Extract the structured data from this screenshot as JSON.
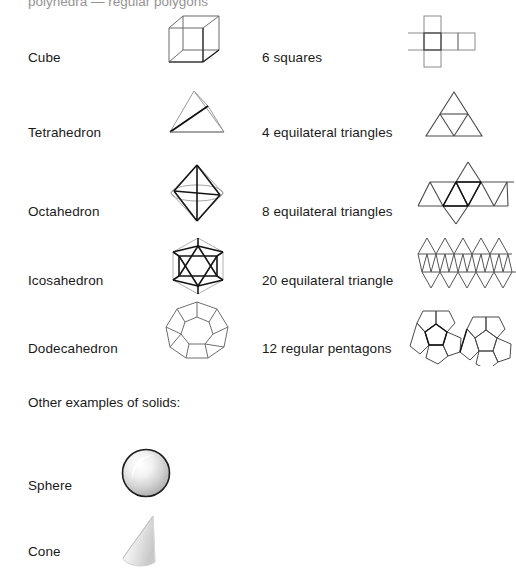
{
  "document": {
    "clipped_header": "polyhedra — regular polygons",
    "section_heading": "Other examples of solids:"
  },
  "platonic_solids": [
    {
      "name": "Cube",
      "solid_icon": "cube-wireframe-icon",
      "faces_description": "6 squares",
      "net_icon": "cube-net-icon"
    },
    {
      "name": "Tetrahedron",
      "solid_icon": "tetrahedron-wireframe-icon",
      "faces_description": "4 equilateral triangles",
      "net_icon": "tetrahedron-net-icon"
    },
    {
      "name": "Octahedron",
      "solid_icon": "octahedron-wireframe-icon",
      "faces_description": "8 equilateral triangles",
      "net_icon": "octahedron-net-icon"
    },
    {
      "name": "Icosahedron",
      "solid_icon": "icosahedron-wireframe-icon",
      "faces_description": "20 equilateral triangle",
      "net_icon": "icosahedron-net-icon"
    },
    {
      "name": "Dodecahedron",
      "solid_icon": "dodecahedron-wireframe-icon",
      "faces_description": "12 regular pentagons",
      "net_icon": "dodecahedron-net-icon"
    }
  ],
  "other_solids": [
    {
      "name": "Sphere",
      "solid_icon": "sphere-shaded-icon"
    },
    {
      "name": "Cone",
      "solid_icon": "cone-shaded-icon"
    }
  ],
  "colors": {
    "background": "#ffffff",
    "text": "#1a1a1a",
    "net_stroke": "#555555",
    "net_stroke_dark": "#222222",
    "solid_stroke": "#6b6b6b",
    "solid_stroke_dark": "#111111"
  }
}
